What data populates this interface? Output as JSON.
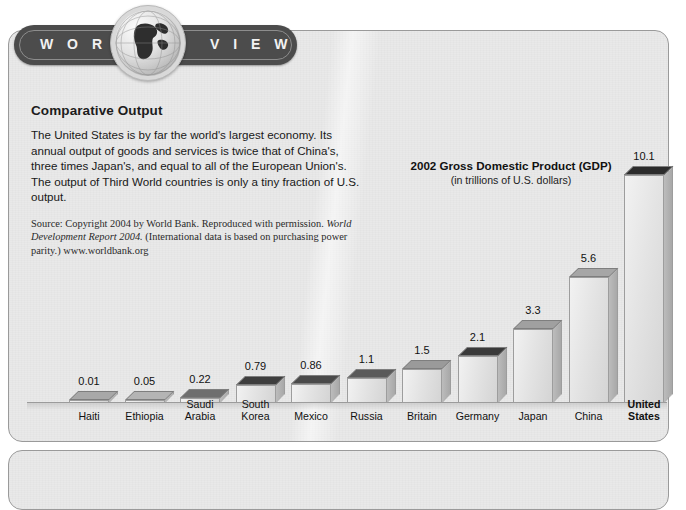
{
  "badge": {
    "word_left": "W O R L D",
    "word_right": "V I E W",
    "globe_icon": "globe-icon"
  },
  "article": {
    "heading": "Comparative Output",
    "body": "The United States is by far the world's largest economy. Its annual output of goods and services is twice that of China's, three times Japan's, and equal to all of the European Union's. The output of Third World countries is only a tiny fraction of U.S. output.",
    "source_prefix": "Source: Copyright 2004 by World Bank. Reproduced with permission. ",
    "source_italic": "World Development Report 2004.",
    "source_suffix": " (International data is based on purchasing power parity.) www.worldbank.org"
  },
  "chart_data": {
    "type": "bar",
    "title": "2002 Gross Domestic Product (GDP)",
    "subtitle": "(in trillions of U.S. dollars)",
    "xlabel": "",
    "ylabel": "",
    "ylim": [
      0,
      10.1
    ],
    "grid": false,
    "legend": "none",
    "categories": [
      "Haiti",
      "Ethiopia",
      "Saudi Arabia",
      "South Korea",
      "Mexico",
      "Russia",
      "Britain",
      "Germany",
      "Japan",
      "China",
      "United States"
    ],
    "values": [
      0.01,
      0.05,
      0.22,
      0.79,
      0.86,
      1.1,
      1.5,
      2.1,
      3.3,
      5.6,
      10.1
    ],
    "value_labels": [
      "0.01",
      "0.05",
      "0.22",
      "0.79",
      "0.86",
      "1.1",
      "1.5",
      "2.1",
      "3.3",
      "5.6",
      "10.1"
    ],
    "category_lines": [
      [
        "Haiti"
      ],
      [
        "Ethiopia"
      ],
      [
        "Saudi",
        "Arabia"
      ],
      [
        "South",
        "Korea"
      ],
      [
        "Mexico"
      ],
      [
        "Russia"
      ],
      [
        "Britain"
      ],
      [
        "Germany"
      ],
      [
        "Japan"
      ],
      [
        "China"
      ],
      [
        "United",
        "States"
      ]
    ],
    "highlight_category": "United States",
    "top_face_shades": [
      "#a8a8a8",
      "#b4b4b4",
      "#6e6e6e",
      "#3e3e3e",
      "#4a4a4a",
      "#5a5a5a",
      "#9a9a9a",
      "#3a3a3a",
      "#a0a0a0",
      "#a6a6a6",
      "#2c2c2c"
    ]
  },
  "colors": {
    "panel_bg": "#e9e9e9",
    "panel_border": "#9a9a9a",
    "badge_bg": "#4c4c4c",
    "badge_text": "#f2f2f2",
    "bar_front": "#e4e4e4",
    "text": "#181818"
  }
}
